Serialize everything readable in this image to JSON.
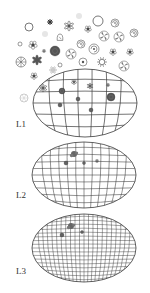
{
  "figure": {
    "stroke_color": "#3a3a3a",
    "icon_color": "#555555"
  },
  "levels": [
    {
      "label": "L1",
      "cx": 85,
      "cy": 103,
      "rx": 52,
      "ry": 34,
      "lat_lines": 6,
      "lon_lines": 7,
      "label_x": 16,
      "label_y": 120
    },
    {
      "label": "L2",
      "cx": 84,
      "cy": 175,
      "rx": 52,
      "ry": 33,
      "lat_lines": 10,
      "lon_lines": 12,
      "label_x": 16,
      "label_y": 191
    },
    {
      "label": "L3",
      "cx": 84,
      "cy": 248,
      "rx": 52,
      "ry": 34,
      "lat_lines": 18,
      "lon_lines": 22,
      "label_x": 16,
      "label_y": 267
    }
  ],
  "scatter_icons": [
    {
      "type": "ring",
      "x": 29,
      "y": 27,
      "r": 4
    },
    {
      "type": "dark-flower",
      "x": 50,
      "y": 22,
      "r": 3
    },
    {
      "type": "star-flower",
      "x": 69,
      "y": 26,
      "r": 5
    },
    {
      "type": "faint",
      "x": 79,
      "y": 16,
      "r": 3
    },
    {
      "type": "small-bug",
      "x": 88,
      "y": 29,
      "r": 4
    },
    {
      "type": "ring",
      "x": 98,
      "y": 21,
      "r": 5
    },
    {
      "type": "spiral",
      "x": 115,
      "y": 23,
      "r": 4
    },
    {
      "type": "faint",
      "x": 45,
      "y": 34,
      "r": 3
    },
    {
      "type": "bell",
      "x": 60,
      "y": 38,
      "r": 4
    },
    {
      "type": "pinwheel",
      "x": 104,
      "y": 36,
      "r": 5
    },
    {
      "type": "pinwheel",
      "x": 119,
      "y": 37,
      "r": 5
    },
    {
      "type": "spiral",
      "x": 134,
      "y": 33,
      "r": 4
    },
    {
      "type": "small-ring",
      "x": 20,
      "y": 44,
      "r": 2
    },
    {
      "type": "bug",
      "x": 33,
      "y": 45,
      "r": 5
    },
    {
      "type": "small-bug",
      "x": 44,
      "y": 51,
      "r": 2
    },
    {
      "type": "spiral",
      "x": 81,
      "y": 44,
      "r": 4
    },
    {
      "type": "dark-disc",
      "x": 55,
      "y": 51,
      "r": 5
    },
    {
      "type": "pinwheel",
      "x": 71,
      "y": 54,
      "r": 5
    },
    {
      "type": "spiral",
      "x": 94,
      "y": 49,
      "r": 5
    },
    {
      "type": "bug",
      "x": 113,
      "y": 52,
      "r": 4
    },
    {
      "type": "small-bug",
      "x": 130,
      "y": 52,
      "r": 4
    },
    {
      "type": "spoke-ring",
      "x": 21,
      "y": 62,
      "r": 5
    },
    {
      "type": "star",
      "x": 37,
      "y": 60,
      "r": 5
    },
    {
      "type": "small-ring",
      "x": 60,
      "y": 65,
      "r": 2
    },
    {
      "type": "ring-dot",
      "x": 83,
      "y": 62,
      "r": 4
    },
    {
      "type": "sun",
      "x": 102,
      "y": 62,
      "r": 5
    },
    {
      "type": "pinwheel",
      "x": 124,
      "y": 66,
      "r": 5
    },
    {
      "type": "faint-flower",
      "x": 53,
      "y": 70,
      "r": 4
    },
    {
      "type": "bug",
      "x": 34,
      "y": 76,
      "r": 4
    },
    {
      "type": "faint-ring",
      "x": 24,
      "y": 98,
      "r": 4
    }
  ],
  "mesh_marks": {
    "L1": [
      {
        "type": "star-flower",
        "x": 43,
        "y": 88,
        "r": 4
      },
      {
        "type": "dark-disc",
        "x": 62,
        "y": 91,
        "r": 3
      },
      {
        "type": "small-bug",
        "x": 74,
        "y": 82,
        "r": 3
      },
      {
        "type": "star-flower",
        "x": 90,
        "y": 86,
        "r": 3
      },
      {
        "type": "small-bug",
        "x": 108,
        "y": 85,
        "r": 2
      },
      {
        "type": "dark-disc",
        "x": 78,
        "y": 99,
        "r": 2
      },
      {
        "type": "dark-disc",
        "x": 111,
        "y": 97,
        "r": 4
      },
      {
        "type": "dark-disc",
        "x": 60,
        "y": 105,
        "r": 2
      },
      {
        "type": "dark-disc",
        "x": 91,
        "y": 110,
        "r": 2
      }
    ],
    "L2": [
      {
        "type": "dark-cluster",
        "x": 74,
        "y": 154,
        "r": 3
      },
      {
        "type": "dark-disc",
        "x": 66,
        "y": 163,
        "r": 2
      },
      {
        "type": "dark-disc",
        "x": 84,
        "y": 163,
        "r": 1.5
      },
      {
        "type": "small-bug",
        "x": 97,
        "y": 161,
        "r": 2
      }
    ],
    "L3": [
      {
        "type": "dark-cluster",
        "x": 71,
        "y": 226,
        "r": 3
      },
      {
        "type": "dark-disc",
        "x": 62,
        "y": 235,
        "r": 2
      },
      {
        "type": "dark-disc",
        "x": 82,
        "y": 232,
        "r": 1.5
      }
    ]
  }
}
